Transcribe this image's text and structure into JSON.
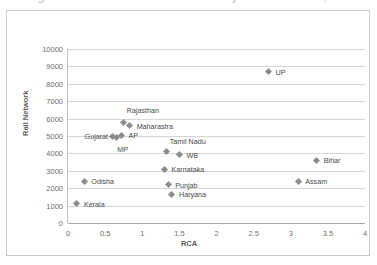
{
  "caption": {
    "text": "Figure 4: Rail Network vs RCA of major Indian states, 2013-14"
  },
  "chart_data": {
    "type": "scatter",
    "title": "",
    "xlabel": "RCA",
    "ylabel": "Rail Network",
    "xlim": [
      0,
      4
    ],
    "ylim": [
      0,
      10000
    ],
    "xticks": [
      "0",
      "0.5",
      "1",
      "1.5",
      "2",
      "2.5",
      "3",
      "3.5",
      "4"
    ],
    "xtick_values": [
      0,
      0.5,
      1,
      1.5,
      2,
      2.5,
      3,
      3.5,
      4
    ],
    "yticks": [
      "0",
      "1000",
      "2000",
      "3000",
      "4000",
      "5000",
      "6000",
      "7000",
      "8000",
      "9000",
      "10000"
    ],
    "ytick_values": [
      0,
      1000,
      2000,
      3000,
      4000,
      5000,
      6000,
      7000,
      8000,
      9000,
      10000
    ],
    "grid": "horizontal",
    "legend": "none",
    "marker_color": "#8c8c8c",
    "points": [
      {
        "label": "UP",
        "x": 2.7,
        "y": 8700,
        "label_side": "right",
        "label_dx": 7,
        "label_dy": 0
      },
      {
        "label": "Rajasthan",
        "x": 0.75,
        "y": 5800,
        "label_side": "left",
        "label_dx": 3,
        "label_dy": -12
      },
      {
        "label": "Maharastra",
        "x": 0.83,
        "y": 5600,
        "label_side": "right",
        "label_dx": 7,
        "label_dy": 0
      },
      {
        "label": "AP",
        "x": 0.72,
        "y": 5050,
        "label_side": "right",
        "label_dx": 7,
        "label_dy": 0
      },
      {
        "label": "Gujarat",
        "x": 0.6,
        "y": 5000,
        "label_side": "right",
        "label_dx": -28,
        "label_dy": 0
      },
      {
        "label": "MP",
        "x": 0.65,
        "y": 4900,
        "label_side": "right",
        "label_dx": 1,
        "label_dy": 11
      },
      {
        "label": "Tamil Nadu",
        "x": 1.33,
        "y": 4100,
        "label_side": "right",
        "label_dx": 3,
        "label_dy": -11
      },
      {
        "label": "WB",
        "x": 1.5,
        "y": 3950,
        "label_side": "right",
        "label_dx": 7,
        "label_dy": 1
      },
      {
        "label": "Bihar",
        "x": 3.35,
        "y": 3600,
        "label_side": "right",
        "label_dx": 7,
        "label_dy": 0
      },
      {
        "label": "Karnataka",
        "x": 1.3,
        "y": 3100,
        "label_side": "right",
        "label_dx": 7,
        "label_dy": 0
      },
      {
        "label": "Odisha",
        "x": 0.22,
        "y": 2400,
        "label_side": "right",
        "label_dx": 7,
        "label_dy": 0
      },
      {
        "label": "Assam",
        "x": 3.1,
        "y": 2400,
        "label_side": "right",
        "label_dx": 7,
        "label_dy": 0
      },
      {
        "label": "Punjab",
        "x": 1.35,
        "y": 2200,
        "label_side": "right",
        "label_dx": 7,
        "label_dy": 0
      },
      {
        "label": "Haryana",
        "x": 1.4,
        "y": 1650,
        "label_side": "right",
        "label_dx": 7,
        "label_dy": 0
      },
      {
        "label": "Kerala",
        "x": 0.12,
        "y": 1100,
        "label_side": "right",
        "label_dx": 7,
        "label_dy": 0
      }
    ]
  }
}
